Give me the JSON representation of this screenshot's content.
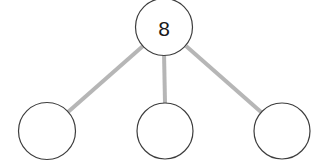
{
  "diagram": {
    "kind": "number-bond",
    "background_color": "#ffffff",
    "circle_stroke_color": "#3d3d3d",
    "circle_fill_color": "#ffffff",
    "circle_stroke_width": 1.2,
    "connector_color": "#b6b6b6",
    "connector_width": 4,
    "text_color": "#1a1a1a",
    "whole": {
      "label": "8",
      "cx": 164,
      "cy": 27,
      "r": 28.5,
      "empty": false
    },
    "parts": [
      {
        "label": "",
        "cx": 47,
        "cy": 131,
        "r": 28.5,
        "empty": true
      },
      {
        "label": "",
        "cx": 165,
        "cy": 131,
        "r": 28,
        "empty": true
      },
      {
        "label": "",
        "cx": 282,
        "cy": 131,
        "r": 28,
        "empty": true
      }
    ],
    "connectors": [
      {
        "from": "whole",
        "to": "part-left",
        "x1": 143,
        "y1": 46,
        "x2": 68,
        "y2": 112
      },
      {
        "from": "whole",
        "to": "part-middle",
        "x1": 164,
        "y1": 52,
        "x2": 165,
        "y2": 103
      },
      {
        "from": "whole",
        "to": "part-right",
        "x1": 186,
        "y1": 46,
        "x2": 261,
        "y2": 112
      }
    ]
  }
}
